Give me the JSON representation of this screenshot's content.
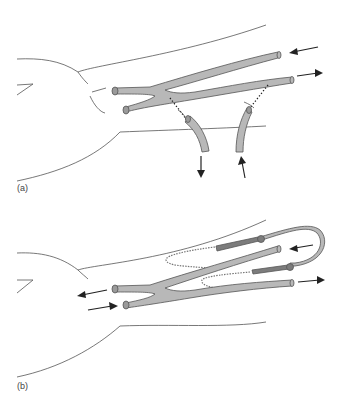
{
  "figure": {
    "panels": [
      {
        "id": "a",
        "label": "(a)",
        "description": "Forearm outline with Y-shaped vein graft; two catheters connected via dotted lines, flow arrows in and out",
        "arrows": [
          {
            "position": "upper-right",
            "direction": "left"
          },
          {
            "position": "right",
            "direction": "right"
          },
          {
            "position": "lower-left-catheter",
            "direction": "down"
          },
          {
            "position": "lower-right-catheter",
            "direction": "up"
          }
        ]
      },
      {
        "id": "b",
        "label": "(b)",
        "description": "Forearm outline with Y-shaped vein graft connected to looped tubing with textured cuffs; flow arrows at ends",
        "arrows": [
          {
            "position": "upper-right",
            "direction": "left"
          },
          {
            "position": "right",
            "direction": "right"
          },
          {
            "position": "left-upper",
            "direction": "left"
          },
          {
            "position": "left-lower",
            "direction": "right"
          }
        ]
      }
    ],
    "colors": {
      "tube_fill": "#b8b8b8",
      "tube_dark": "#7c7c7c",
      "outline": "#555555",
      "arrow": "#222222",
      "background": "#ffffff"
    }
  }
}
